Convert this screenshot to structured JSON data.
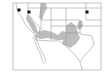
{
  "map": {
    "type": "range-map",
    "region": "Western United States and northern Mexico",
    "colors": {
      "background": "#ffffff",
      "border": "#8a8a8a",
      "range_fill": "#bdbdbd",
      "point": "#111111"
    },
    "range_areas": [
      {
        "name": "california-central-valley",
        "points": "27,14 31,18 36,26 38,33 34,33 30,26 26,19"
      },
      {
        "name": "great-basin-strip",
        "points": "41,3 46,3 47,8 44,14 42,20 39,18 40,10"
      },
      {
        "name": "desert-southwest-band",
        "points": "36,32 44,30 52,32 58,35 62,31 66,32 64,40 56,40 48,38 40,39 35,37"
      },
      {
        "name": "new-mexico-texas-area",
        "points": "66,26 71,22 76,26 78,33 80,38 76,44 70,48 66,46 62,44 64,38 66,32"
      },
      {
        "name": "eastern-plains-patch",
        "points": "78,22 82,20 83,26 80,30 77,28"
      }
    ],
    "points": [
      {
        "name": "northern-california-site",
        "x": 19,
        "y": 10
      },
      {
        "name": "sierra-site",
        "x": 29,
        "y": 12
      },
      {
        "name": "midwest-site",
        "x": 87,
        "y": 12
      }
    ]
  }
}
